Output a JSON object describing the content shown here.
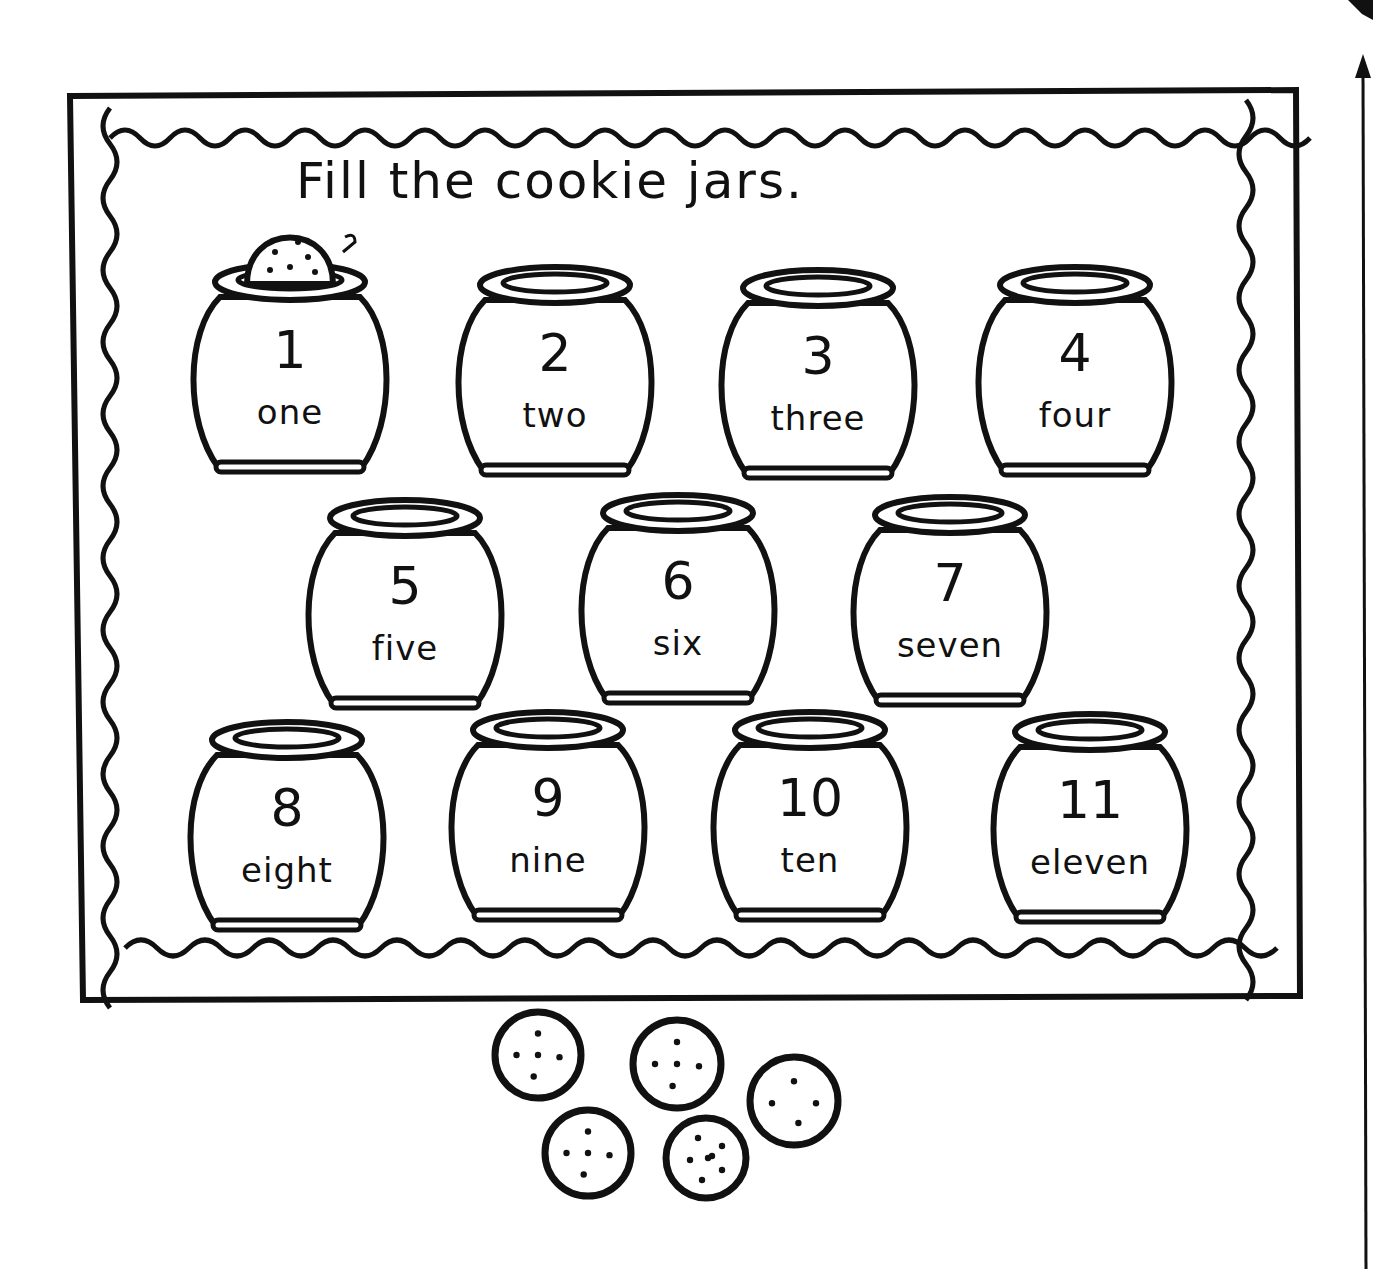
{
  "worksheet": {
    "title": "Fill the cookie jars.",
    "example_annotation": "2",
    "ink_color": "#111111",
    "paper_color": "#ffffff"
  },
  "jars": [
    {
      "number": "1",
      "word": "one",
      "has_cookie": true,
      "x": 190,
      "y": 262
    },
    {
      "number": "2",
      "word": "two",
      "has_cookie": false,
      "x": 455,
      "y": 265
    },
    {
      "number": "3",
      "word": "three",
      "has_cookie": false,
      "x": 718,
      "y": 268
    },
    {
      "number": "4",
      "word": "four",
      "has_cookie": false,
      "x": 975,
      "y": 265
    },
    {
      "number": "5",
      "word": "five",
      "has_cookie": false,
      "x": 305,
      "y": 498
    },
    {
      "number": "6",
      "word": "six",
      "has_cookie": false,
      "x": 578,
      "y": 493
    },
    {
      "number": "7",
      "word": "seven",
      "has_cookie": false,
      "x": 850,
      "y": 495
    },
    {
      "number": "8",
      "word": "eight",
      "has_cookie": false,
      "x": 187,
      "y": 720
    },
    {
      "number": "9",
      "word": "nine",
      "has_cookie": false,
      "x": 448,
      "y": 710
    },
    {
      "number": "10",
      "word": "ten",
      "has_cookie": false,
      "x": 710,
      "y": 710
    },
    {
      "number": "11",
      "word": "eleven",
      "has_cookie": false,
      "x": 990,
      "y": 712
    }
  ],
  "cookies": [
    {
      "cx": 538,
      "cy": 1055,
      "r": 43,
      "dots": 5
    },
    {
      "cx": 677,
      "cy": 1064,
      "r": 44,
      "dots": 5
    },
    {
      "cx": 794,
      "cy": 1101,
      "r": 44,
      "dots": 4
    },
    {
      "cx": 588,
      "cy": 1153,
      "r": 43,
      "dots": 5
    },
    {
      "cx": 706,
      "cy": 1158,
      "r": 40,
      "dots": 7
    }
  ],
  "margin_arrow": {
    "direction": "up"
  }
}
